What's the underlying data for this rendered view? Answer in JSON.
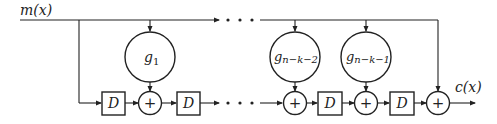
{
  "diagram": {
    "type": "systematic-cyclic-encoder-shift-register",
    "input_label": "m(x)",
    "output_label": "c(x)",
    "delay_label": "D",
    "adder_symbol": "+",
    "coefficients": [
      {
        "base": "g",
        "sub": "1"
      },
      {
        "base": "g",
        "sub": "n−k−2"
      },
      {
        "base": "g",
        "sub": "n−k−1"
      }
    ],
    "ellipsis": "• • •",
    "colors": {
      "stroke": "#222222",
      "background": "#ffffff"
    }
  }
}
